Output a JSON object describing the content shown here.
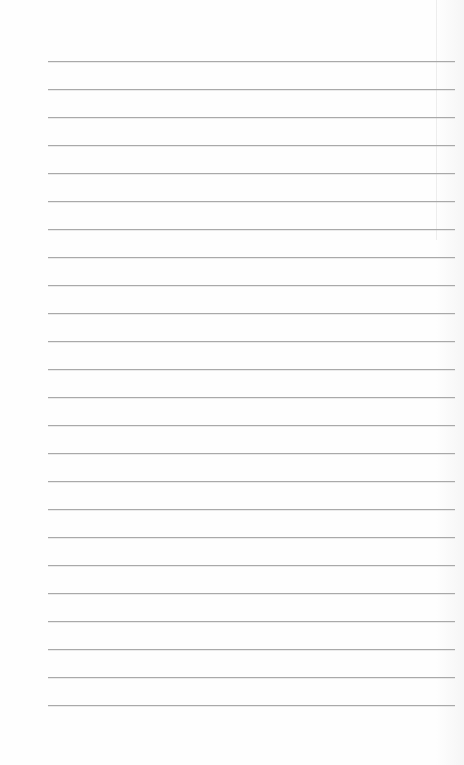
{
  "document": {
    "type": "lined-paper",
    "background_color": "#fefefe",
    "rule_color": "#a9a9a9",
    "rules": {
      "count": 24,
      "first_y": 61,
      "spacing": 28,
      "left_x": 48,
      "right_x": 455
    },
    "text": []
  }
}
